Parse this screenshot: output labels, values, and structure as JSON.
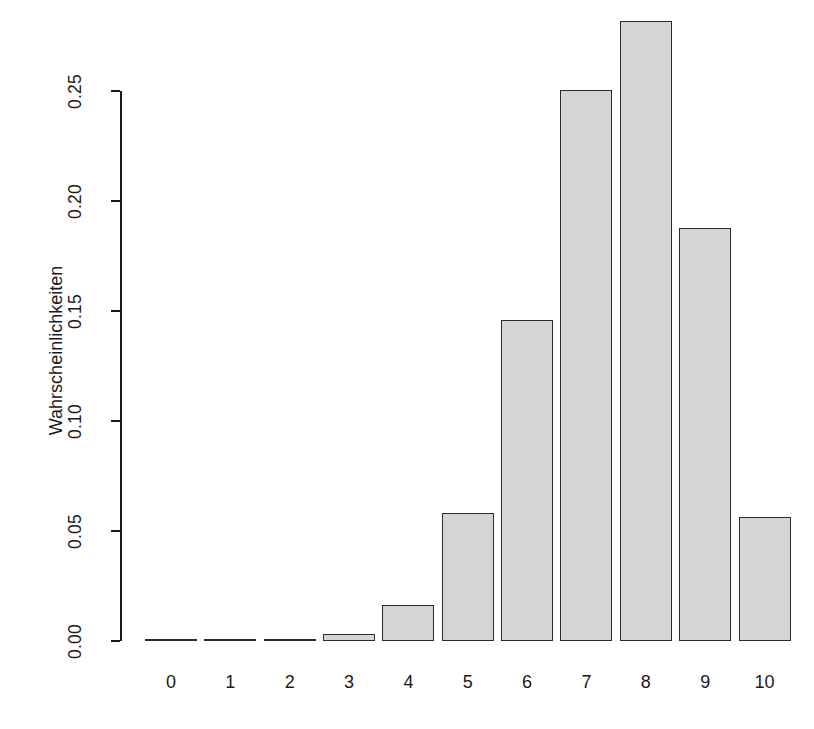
{
  "chart_data": {
    "type": "bar",
    "title": "",
    "subtitle": "",
    "xlabel": "",
    "ylabel": "Wahrscheinlichkeiten",
    "categories": [
      "0",
      "1",
      "2",
      "3",
      "4",
      "5",
      "6",
      "7",
      "8",
      "9",
      "10"
    ],
    "values": [
      0.0,
      0.0,
      0.0004,
      0.0031,
      0.0162,
      0.0584,
      0.146,
      0.2503,
      0.2816,
      0.1877,
      0.0563
    ],
    "ylim": [
      0.0,
      0.28
    ],
    "xlim": [
      0,
      11
    ],
    "y_ticks": [
      0.0,
      0.05,
      0.1,
      0.15,
      0.2,
      0.25
    ],
    "y_tick_labels": [
      "0.00",
      "0.05",
      "0.10",
      "0.15",
      "0.20",
      "0.25"
    ],
    "x_tick_labels": [
      "0",
      "1",
      "2",
      "3",
      "4",
      "5",
      "6",
      "7",
      "8",
      "9",
      "10"
    ],
    "grid": false,
    "legend": null,
    "legend_position": "none",
    "annotations": [],
    "bar_fill_color": "#d5d5d5",
    "bar_border_color": "#2b2b2b",
    "axis_color": "#1a1a1a",
    "background_color": "#ffffff"
  }
}
